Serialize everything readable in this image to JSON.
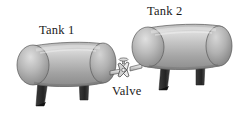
{
  "figure": {
    "background_color": "#ffffff",
    "width": 240,
    "height": 114
  },
  "labels": {
    "tank1": "Tank 1",
    "tank2": "Tank 2",
    "valve": "Valve"
  },
  "objects": {
    "tank1": {
      "name": "Tank 1",
      "shape": "horizontal-cylinder",
      "fill_light": "#d8d8d8",
      "fill_mid": "#a9a9a9",
      "fill_dark": "#7b7b7b",
      "outline_color": "#4a4a4a",
      "legs": 2,
      "leg_color": "#2b2b2b"
    },
    "tank2": {
      "name": "Tank 2",
      "shape": "horizontal-cylinder",
      "fill_light": "#dcdcdc",
      "fill_mid": "#aeaeae",
      "fill_dark": "#808080",
      "outline_color": "#4a4a4a",
      "legs": 2,
      "leg_color": "#2b2b2b"
    },
    "valve": {
      "name": "Valve",
      "shape": "butterfly-valve-with-pipe",
      "fill": "#e6e6e6",
      "outline_color": "#3d3d3d"
    }
  },
  "colors": {
    "text": "#1a1a1a",
    "metal_light": "#dcdcdc",
    "metal_mid": "#aeaeae",
    "metal_dark": "#7b7b7b",
    "leg": "#2b2b2b",
    "background": "#ffffff"
  }
}
